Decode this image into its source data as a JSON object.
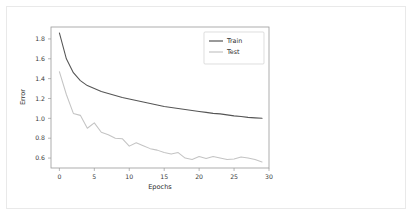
{
  "figure": {
    "background_color": "#ffffff",
    "frame_color": "#e9e9e9",
    "axis_color": "#9a9a9a"
  },
  "chart_data": {
    "type": "line",
    "title": "",
    "xlabel": "Epochs",
    "ylabel": "Error",
    "xlim": [
      -1.2,
      30
    ],
    "ylim": [
      0.5,
      1.92
    ],
    "xticks": [
      "0",
      "5",
      "10",
      "15",
      "20",
      "25",
      "30"
    ],
    "xtick_values": [
      0,
      5,
      10,
      15,
      20,
      25,
      30
    ],
    "yticks": [
      "0.6",
      "0.8",
      "1.0",
      "1.2",
      "1.4",
      "1.6",
      "1.8"
    ],
    "ytick_values": [
      0.6,
      0.8,
      1.0,
      1.2,
      1.4,
      1.6,
      1.8
    ],
    "grid": false,
    "legend_position": "upper right",
    "legend_entries": [
      "Train",
      "Test"
    ],
    "x": [
      0,
      1,
      2,
      3,
      4,
      5,
      6,
      7,
      8,
      9,
      10,
      11,
      12,
      13,
      14,
      15,
      16,
      17,
      18,
      19,
      20,
      21,
      22,
      23,
      24,
      25,
      26,
      27,
      28,
      29
    ],
    "series": [
      {
        "name": "Train",
        "color": "#555555",
        "values": [
          1.86,
          1.6,
          1.46,
          1.38,
          1.33,
          1.3,
          1.27,
          1.25,
          1.23,
          1.21,
          1.195,
          1.18,
          1.165,
          1.15,
          1.135,
          1.12,
          1.11,
          1.1,
          1.09,
          1.08,
          1.07,
          1.06,
          1.05,
          1.045,
          1.035,
          1.025,
          1.018,
          1.01,
          1.005,
          1.0
        ]
      },
      {
        "name": "Test",
        "color": "#c4c4c4",
        "values": [
          1.47,
          1.24,
          1.05,
          1.03,
          0.9,
          0.955,
          0.86,
          0.835,
          0.8,
          0.795,
          0.72,
          0.755,
          0.725,
          0.695,
          0.68,
          0.655,
          0.64,
          0.655,
          0.6,
          0.585,
          0.615,
          0.595,
          0.615,
          0.6,
          0.585,
          0.59,
          0.61,
          0.6,
          0.585,
          0.56
        ]
      }
    ]
  }
}
